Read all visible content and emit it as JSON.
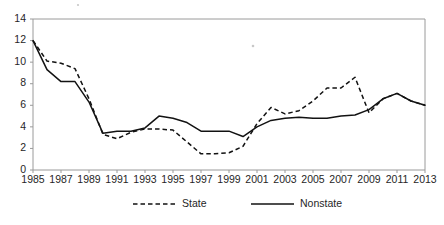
{
  "chart_data": {
    "type": "line",
    "title": "",
    "subtitle": "",
    "xlabel": "",
    "ylabel": "",
    "xlim": [
      1985,
      2013
    ],
    "ylim": [
      0,
      14
    ],
    "grid": false,
    "legend_position": "bottom",
    "y_ticks": [
      0,
      2,
      4,
      6,
      8,
      10,
      12,
      14
    ],
    "x_ticks": [
      1985,
      1987,
      1989,
      1991,
      1993,
      1995,
      1997,
      1999,
      2001,
      2003,
      2005,
      2007,
      2009,
      2011,
      2013
    ],
    "x": [
      1985,
      1986,
      1987,
      1988,
      1989,
      1990,
      1991,
      1992,
      1993,
      1994,
      1995,
      1996,
      1997,
      1998,
      1999,
      2000,
      2001,
      2002,
      2003,
      2004,
      2005,
      2006,
      2007,
      2008,
      2009,
      2010,
      2011,
      2012,
      2013
    ],
    "series": [
      {
        "name": "State",
        "style": "dashed",
        "color": "#121212",
        "values": [
          12.0,
          10.1,
          9.9,
          9.4,
          6.6,
          3.3,
          2.9,
          3.5,
          3.8,
          3.8,
          3.7,
          2.6,
          1.5,
          1.5,
          1.6,
          2.2,
          4.3,
          5.8,
          5.2,
          5.5,
          6.4,
          7.6,
          7.6,
          8.6,
          5.3,
          6.6,
          7.1,
          6.4,
          6.0
        ]
      },
      {
        "name": "Nonstate",
        "style": "solid",
        "color": "#121212",
        "values": [
          12.0,
          9.3,
          8.2,
          8.2,
          6.3,
          3.4,
          3.6,
          3.6,
          3.9,
          5.0,
          4.8,
          4.4,
          3.6,
          3.6,
          3.6,
          3.1,
          4.0,
          4.6,
          4.8,
          4.9,
          4.8,
          4.8,
          5.0,
          5.1,
          5.6,
          6.6,
          7.1,
          6.4,
          6.0
        ]
      }
    ]
  },
  "legend": {
    "items": [
      {
        "label": "State",
        "style": "dashed"
      },
      {
        "label": "Nonstate",
        "style": "solid"
      }
    ]
  }
}
